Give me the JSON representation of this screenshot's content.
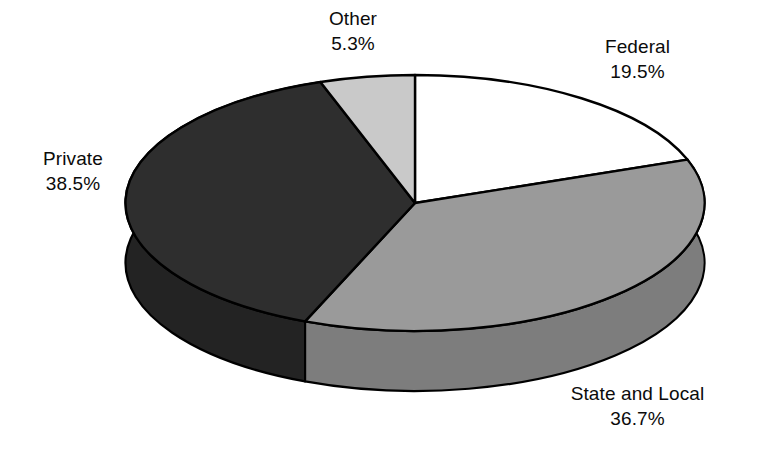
{
  "chart_data": {
    "type": "pie",
    "title": "",
    "subtitle": "",
    "xlabel": "",
    "ylabel": "",
    "legend_position": "none",
    "grid": false,
    "style": "3d-exploded-none-grayscale",
    "start_angle_deg": 0,
    "direction": "clockwise",
    "categories": [
      "Federal",
      "State and Local",
      "Private",
      "Other"
    ],
    "values": [
      19.5,
      36.7,
      38.5,
      5.3
    ],
    "value_suffix": "%",
    "slices": [
      {
        "label": "Federal",
        "value": 19.5,
        "pct_text": "19.5%",
        "color": "#ffffff",
        "side_color": "#d8d8d8"
      },
      {
        "label": "State and Local",
        "value": 36.7,
        "pct_text": "36.7%",
        "color": "#9a9a9a",
        "side_color": "#7d7d7d"
      },
      {
        "label": "Private",
        "value": 38.5,
        "pct_text": "38.5%",
        "color": "#2e2e2e",
        "side_color": "#232323"
      },
      {
        "label": "Other",
        "value": 5.3,
        "pct_text": "5.3%",
        "color": "#c9c9c9",
        "side_color": "#ababab"
      }
    ]
  },
  "labels": {
    "other": {
      "name": "Other",
      "pct": "5.3%"
    },
    "federal": {
      "name": "Federal",
      "pct": "19.5%"
    },
    "private": {
      "name": "Private",
      "pct": "38.5%"
    },
    "state": {
      "name": "State and Local",
      "pct": "36.7%"
    }
  },
  "colors": {
    "background": "#ffffff",
    "outline": "#000000",
    "text": "#0b0b0b",
    "federal_fill": "#ffffff",
    "state_fill": "#9a9a9a",
    "private_fill": "#2e2e2e",
    "other_fill": "#c9c9c9"
  }
}
